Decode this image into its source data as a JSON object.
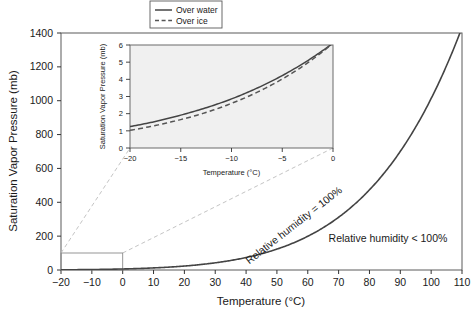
{
  "chart_data": {
    "type": "line",
    "title": "",
    "xlabel": "Temperature (°C)",
    "ylabel": "Saturation Vapor Pressure (mb)",
    "xlim": [
      -20,
      110
    ],
    "ylim": [
      0,
      1400
    ],
    "xticks": [
      -20,
      -10,
      0,
      10,
      20,
      30,
      40,
      50,
      60,
      70,
      80,
      90,
      100,
      110
    ],
    "xticklabels": [
      "−20",
      "−10",
      "0",
      "10",
      "20",
      "30",
      "40",
      "50",
      "60",
      "70",
      "80",
      "90",
      "100",
      "110"
    ],
    "yticks": [
      0,
      200,
      400,
      600,
      800,
      1000,
      1200,
      1400
    ],
    "yticklabels": [
      "0",
      "200",
      "400",
      "600",
      "800",
      "1000",
      "1200",
      "1400"
    ],
    "grid": false,
    "legend_position": "top-center",
    "series": [
      {
        "name": "Over water",
        "style": "solid",
        "color": "#444444",
        "x": [
          -20,
          -10,
          0,
          5,
          10,
          15,
          20,
          25,
          30,
          35,
          40,
          45,
          50,
          55,
          60,
          65,
          70,
          75,
          80,
          85,
          90,
          95,
          100,
          105,
          110
        ],
        "y": [
          1.25,
          2.86,
          6.11,
          8.72,
          12.27,
          17.04,
          23.37,
          31.67,
          42.43,
          56.24,
          73.78,
          95.86,
          123.4,
          157.46,
          199.26,
          250.16,
          311.69,
          385.56,
          473.67,
          578.09,
          701.13,
          845.28,
          1013.25,
          1208.0,
          1433.0
        ]
      },
      {
        "name": "Over ice",
        "style": "dashed",
        "color": "#555555",
        "x": [
          -20,
          -18,
          -16,
          -14,
          -12,
          -10,
          -8,
          -6,
          -4,
          -2,
          0
        ],
        "y": [
          1.03,
          1.25,
          1.51,
          1.81,
          2.17,
          2.6,
          3.1,
          3.69,
          4.37,
          5.17,
          6.11
        ]
      }
    ],
    "annotations": [
      {
        "text": "Relative humidity = 100%",
        "position": "along-curve",
        "rotation": -37
      },
      {
        "text": "Relative humidity < 100%",
        "position": "right-of-curve",
        "rotation": 0
      }
    ],
    "inset": {
      "xlabel": "Temperature (°C)",
      "ylabel": "Saturation Vapor Pressure (mb)",
      "xlim": [
        -20,
        0
      ],
      "ylim": [
        0,
        6
      ],
      "xticks": [
        -20,
        -15,
        -10,
        -5,
        0
      ],
      "xticklabels": [
        "−20",
        "−15",
        "−10",
        "−5",
        "0"
      ],
      "yticks": [
        0,
        1,
        2,
        3,
        4,
        5,
        6
      ],
      "yticklabels": [
        "0",
        "1",
        "2",
        "3",
        "4",
        "5",
        "6"
      ],
      "background": "#f0f0f0",
      "series": [
        {
          "name": "Over water",
          "style": "solid",
          "color": "#444444",
          "x": [
            -20,
            -18,
            -16,
            -14,
            -12,
            -10,
            -8,
            -6,
            -4,
            -2,
            -1,
            0
          ],
          "y": [
            1.25,
            1.48,
            1.76,
            2.08,
            2.44,
            2.86,
            3.35,
            3.91,
            4.55,
            5.28,
            5.68,
            6.11
          ]
        },
        {
          "name": "Over ice",
          "style": "dashed",
          "color": "#555555",
          "x": [
            -20,
            -18,
            -16,
            -14,
            -12,
            -10,
            -8,
            -6,
            -4,
            -2,
            -1,
            0
          ],
          "y": [
            1.03,
            1.25,
            1.51,
            1.81,
            2.17,
            2.6,
            3.1,
            3.69,
            4.37,
            5.17,
            5.62,
            6.11
          ]
        }
      ],
      "source_region": {
        "x": [
          -20,
          0
        ],
        "y": [
          0,
          40
        ]
      }
    },
    "colors": {
      "line_water": "#444444",
      "line_ice": "#555555",
      "axis": "#333333",
      "inset_background": "#f0f0f0",
      "connector": "#bdbdbd"
    }
  },
  "legend": {
    "items": [
      {
        "label": "Over water",
        "style": "solid"
      },
      {
        "label": "Over ice",
        "style": "dashed"
      }
    ]
  }
}
